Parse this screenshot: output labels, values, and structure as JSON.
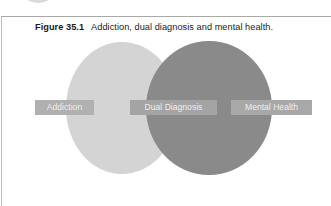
{
  "figure": {
    "number": "Figure 35.1",
    "caption": "Addiction, dual diagnosis and mental health."
  },
  "diagram": {
    "type": "venn",
    "sets": [
      {
        "id": "addiction",
        "label": "Addiction",
        "color": "#d4d4d4"
      },
      {
        "id": "mental_health",
        "label": "Mental Health",
        "color": "#8a8a8a"
      }
    ],
    "intersection": {
      "label": "Dual Diagnosis"
    }
  },
  "labels": {
    "addiction": "Addiction",
    "dual_diagnosis": "Dual Diagnosis",
    "mental_health": "Mental Health"
  }
}
